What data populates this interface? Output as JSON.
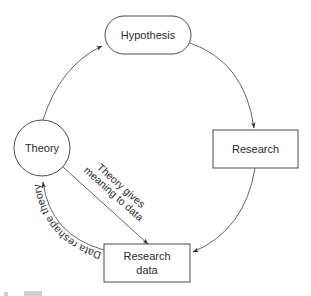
{
  "diagram": {
    "type": "cycle",
    "nodes": [
      {
        "id": "hypothesis",
        "label": "Hypothesis",
        "shape": "rounded-pill"
      },
      {
        "id": "research",
        "label": "Research",
        "shape": "rectangle"
      },
      {
        "id": "research_data",
        "label_line1": "Research",
        "label_line2": "data",
        "shape": "rectangle"
      },
      {
        "id": "theory",
        "label": "Theory",
        "shape": "circle"
      }
    ],
    "edges": [
      {
        "from": "theory",
        "to": "hypothesis",
        "label": ""
      },
      {
        "from": "hypothesis",
        "to": "research",
        "label": ""
      },
      {
        "from": "research",
        "to": "research_data",
        "label": ""
      },
      {
        "from": "theory",
        "to": "research_data",
        "label_line1": "Theory gives",
        "label_line2": "meaning to data"
      },
      {
        "from": "research_data",
        "to": "theory",
        "label": "Data reshape theory"
      }
    ],
    "colors": {
      "stroke": "#4a4a4a",
      "text": "#2a2a2a",
      "background": "#ffffff"
    }
  }
}
